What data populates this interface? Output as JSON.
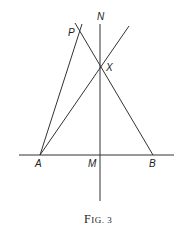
{
  "diagram": {
    "caption": "Fig. 3",
    "caption_first": "F",
    "caption_rest": "IG. 3",
    "points": {
      "A": {
        "label": "A",
        "x": 40,
        "y": 155
      },
      "M": {
        "label": "M",
        "x": 100,
        "y": 155
      },
      "B": {
        "label": "B",
        "x": 153,
        "y": 155
      },
      "X": {
        "label": "X",
        "x": 100,
        "y": 68
      },
      "N": {
        "label": "N",
        "x": 100,
        "y": 24
      },
      "P": {
        "label": "P",
        "x": 79,
        "y": 31
      }
    },
    "lines": [
      {
        "name": "baseline-AB",
        "x1": 19,
        "y1": 155,
        "x2": 174,
        "y2": 155
      },
      {
        "name": "perpendicular-MN",
        "x1": 100,
        "y1": 24,
        "x2": 100,
        "y2": 201
      },
      {
        "name": "line-A-through-X",
        "x1": 40,
        "y1": 155,
        "x2": 129,
        "y2": 26
      },
      {
        "name": "line-B-through-X-to-P",
        "x1": 153,
        "y1": 155,
        "x2": 75,
        "y2": 23
      },
      {
        "name": "line-A-to-P",
        "x1": 40,
        "y1": 155,
        "x2": 82,
        "y2": 24
      }
    ],
    "stroke_color": "#333333"
  }
}
